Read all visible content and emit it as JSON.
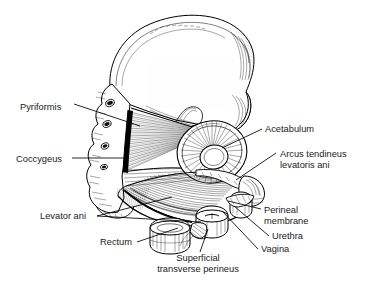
{
  "figure": {
    "type": "anatomical-line-drawing",
    "style": "pen-and-ink engraving, black on white",
    "background_color": "#ffffff",
    "ink_color": "#000000",
    "width": 366,
    "height": 291
  },
  "labels": [
    {
      "id": "pyriformis",
      "text": "Pyriformis",
      "text_x": 20,
      "text_y": 110,
      "anchor": "start",
      "lines": 1,
      "leader": "M74,104 L140,126"
    },
    {
      "id": "coccygeus",
      "text": "Coccygeus",
      "text_x": 16,
      "text_y": 162,
      "anchor": "start",
      "lines": 1,
      "leader": "M72,158 L126,158"
    },
    {
      "id": "acetabulum",
      "text": "Acetabulum",
      "text_x": 265,
      "text_y": 132,
      "anchor": "start",
      "lines": 1,
      "leader": "M262,129 L222,148"
    },
    {
      "id": "arcus-tendineus-levatoris-ani",
      "text": "Arcus tendineus",
      "text2": "levatoris ani",
      "text_x": 280,
      "text_y": 157,
      "text_y2": 168,
      "anchor": "start",
      "lines": 2,
      "leader": "M276,153 L236,180"
    },
    {
      "id": "levator-ani",
      "text": "Levator ani",
      "text_x": 40,
      "text_y": 219,
      "anchor": "start",
      "lines": 1,
      "leader": "M97,216 L172,197",
      "leader2": "M97,216 L201,222"
    },
    {
      "id": "rectum",
      "text": "Rectum",
      "text_x": 100,
      "text_y": 245,
      "anchor": "start",
      "lines": 1,
      "leader": "M137,242 L178,228"
    },
    {
      "id": "perineal-membrane",
      "text": "Perineal",
      "text2": "membrane",
      "text_x": 264,
      "text_y": 213,
      "text_y2": 224,
      "anchor": "start",
      "lines": 2,
      "leader": "M261,209 L228,201"
    },
    {
      "id": "urethra",
      "text": "Urethra",
      "text_x": 272,
      "text_y": 239,
      "anchor": "start",
      "lines": 1,
      "leader": "M269,236 L234,206"
    },
    {
      "id": "vagina",
      "text": "Vagina",
      "text_x": 261,
      "text_y": 252,
      "anchor": "start",
      "lines": 1,
      "leader": "M258,249 L222,211"
    },
    {
      "id": "superficial-transverse-perineus",
      "text": "Superficial",
      "text2": "transverse perineus",
      "text_x": 198,
      "text_y": 261,
      "text_y2": 272,
      "anchor": "middle",
      "lines": 2,
      "leader": "M200,252 L208,229"
    }
  ],
  "structures": [
    {
      "id": "ilium-wing",
      "name": "Ilium / iliac crest"
    },
    {
      "id": "sacrum",
      "name": "Sacrum with foramina"
    },
    {
      "id": "piriformis-fan",
      "name": "Piriformis muscle fan"
    },
    {
      "id": "coccygeus-muscle",
      "name": "Coccygeus muscle"
    },
    {
      "id": "acetabulum-socket",
      "name": "Acetabulum"
    },
    {
      "id": "levator-ani-sheet",
      "name": "Levator ani sheet"
    },
    {
      "id": "rectum-tube",
      "name": "Rectum"
    },
    {
      "id": "vagina-tube",
      "name": "Vagina"
    },
    {
      "id": "urethra-tube",
      "name": "Urethra"
    },
    {
      "id": "perineal-membrane-struct",
      "name": "Perineal membrane"
    },
    {
      "id": "transverse-perineus-struct",
      "name": "Superficial transverse perineus"
    },
    {
      "id": "pubic-ramus",
      "name": "Pubic ramus"
    },
    {
      "id": "femur-head-stump",
      "name": "Femur head / greater trochanter stump"
    }
  ]
}
